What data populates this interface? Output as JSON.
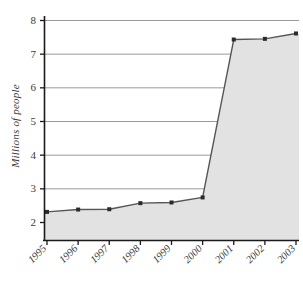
{
  "chart_data": {
    "type": "area",
    "title": "",
    "subtitle": "",
    "xlabel": "",
    "ylabel": "Millions of people",
    "categories": [
      "1995",
      "1996",
      "1997",
      "1998",
      "1999",
      "2000",
      "2001",
      "2002",
      "2003"
    ],
    "values": [
      2.3,
      2.37,
      2.38,
      2.56,
      2.58,
      2.73,
      7.42,
      7.44,
      7.6
    ],
    "series": [
      {
        "name": "Millions of people",
        "values": [
          2.3,
          2.37,
          2.38,
          2.56,
          2.58,
          2.73,
          7.42,
          7.44,
          7.6
        ]
      }
    ],
    "ylim": [
      2,
      8
    ],
    "xlim": [
      "1995",
      "2003"
    ],
    "ytick_labels": [
      "8",
      "7",
      "6",
      "5",
      "4",
      "3",
      "2"
    ],
    "ytick_values": [
      8,
      7,
      6,
      5,
      4,
      3,
      2
    ],
    "xtick_labels": [
      "1995",
      "1996",
      "1997",
      "1998",
      "1999",
      "2000",
      "2001",
      "2002",
      "2003"
    ],
    "grid": true,
    "grid_axis": "y",
    "legend": false,
    "legend_position": "none",
    "markers": "square",
    "annotations": []
  },
  "style": {
    "fill_color": "#e2e2e2",
    "line_color": "#555555",
    "marker_color": "#2b2b2b",
    "grid_color": "#9a9a9a",
    "axis_color": "#1a1a1a",
    "background": "#ffffff",
    "text_color": "#3c3c3c"
  }
}
